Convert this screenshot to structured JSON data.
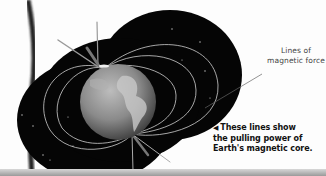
{
  "illustration": {
    "subject": "Earth magnetic field lines",
    "colors": {
      "background": "#fdfdfd",
      "field_region": "#050505",
      "field_lines": "#cfcfcf",
      "globe": "#8a8a8a",
      "text": "#111111",
      "label_text": "#444444"
    }
  },
  "labels": {
    "field_label": "Lines of magnetic force",
    "field_label_line1": "Lines of",
    "field_label_line2": "magnetic force"
  },
  "caption": {
    "arrow_icon": "◀",
    "line1": "These lines show",
    "line2": "the pulling power of",
    "line3": "Earth's magnetic core."
  }
}
